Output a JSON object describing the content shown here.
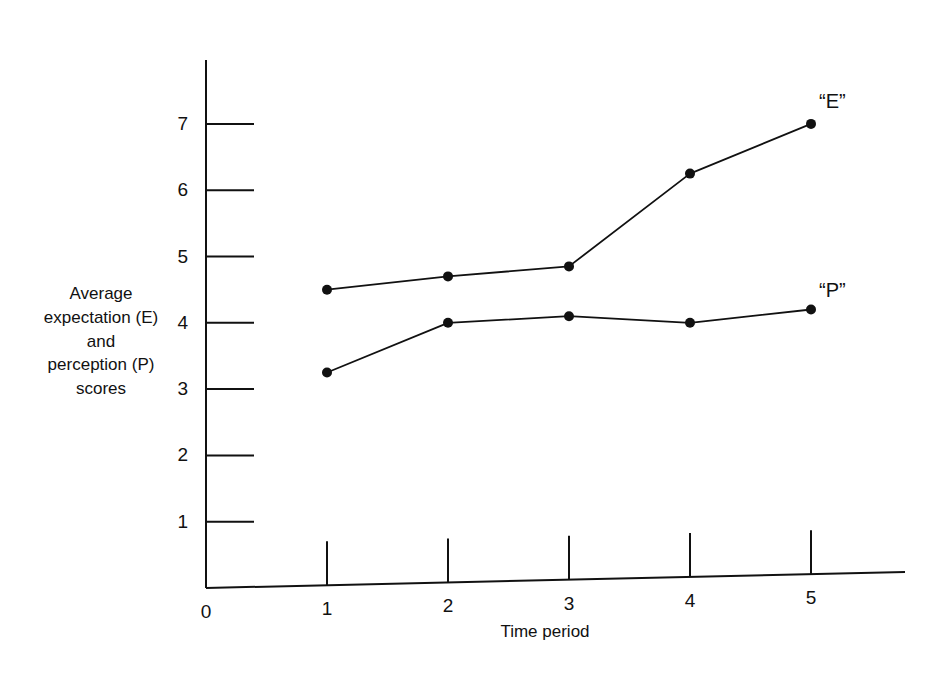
{
  "figure": {
    "clipped_top_text": ". .",
    "background_color": "#ffffff",
    "ink_color": "#111111"
  },
  "axes": {
    "y_label_lines": [
      "Average",
      "expectation (E)",
      "and",
      "perception (P)",
      "scores"
    ],
    "x_label": "Time period",
    "y_ticks": [
      "1",
      "2",
      "3",
      "4",
      "5",
      "6",
      "7"
    ],
    "x_ticks": [
      "0",
      "1",
      "2",
      "3",
      "4",
      "5"
    ]
  },
  "chart_data": {
    "type": "line",
    "title": "",
    "xlabel": "Time period",
    "ylabel": "Average expectation (E) and perception (P) scores",
    "x": [
      1,
      2,
      3,
      4,
      5
    ],
    "xlim": [
      0,
      5.75
    ],
    "ylim": [
      0,
      7.9
    ],
    "grid": false,
    "legend": "inline-end-labels",
    "xticklabels": [
      "0",
      "1",
      "2",
      "3",
      "4",
      "5"
    ],
    "yticklabels": [
      "1",
      "2",
      "3",
      "4",
      "5",
      "6",
      "7"
    ],
    "series": [
      {
        "name": "“E”",
        "label": "“E”",
        "marker": "filled-circle",
        "values": [
          4.5,
          4.7,
          4.85,
          6.25,
          7.0
        ]
      },
      {
        "name": "“P”",
        "label": "“P”",
        "marker": "filled-circle",
        "values": [
          3.25,
          4.0,
          4.1,
          4.0,
          4.2
        ]
      }
    ],
    "annotations": [
      {
        "text": "“E”",
        "x": 5.1,
        "y": 7.35
      },
      {
        "text": "“P”",
        "x": 5.1,
        "y": 4.5
      }
    ]
  },
  "geometry": {
    "origin_x": 206,
    "origin_y": 588,
    "y_axis_top": 60,
    "x_axis_right": 905,
    "x_axis_right_y": 572,
    "unit_x": 121,
    "unit_y": 66.3,
    "ytick_len": 48,
    "xtick_len": 44
  }
}
